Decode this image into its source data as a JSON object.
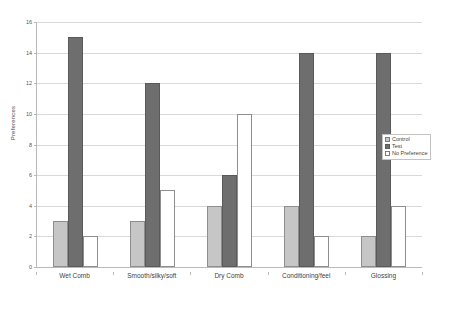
{
  "chart_data": {
    "type": "bar",
    "title": "",
    "subtitle": "",
    "xlabel": "",
    "ylabel": "Preferences",
    "ylim": [
      0,
      16
    ],
    "ytick_step": 2,
    "yticks": [
      0,
      2,
      4,
      6,
      8,
      10,
      12,
      14,
      16
    ],
    "grid": true,
    "legend_position": "right-middle",
    "categories": [
      "Wet Comb",
      "Smooth/silky/soft",
      "Dry Comb",
      "Conditioning/feel",
      "Glossing"
    ],
    "series": [
      {
        "name": "Control",
        "color": "#c6c6c6",
        "values": [
          3,
          3,
          4,
          4,
          2
        ]
      },
      {
        "name": "Test",
        "color": "#6e6e6e",
        "values": [
          15,
          12,
          6,
          14,
          14
        ]
      },
      {
        "name": "No Preference",
        "color": "#ffffff",
        "values": [
          2,
          5,
          10,
          2,
          4
        ]
      }
    ]
  },
  "legend": {
    "items": [
      {
        "label": "Control"
      },
      {
        "label": "Test"
      },
      {
        "label": "No Preference"
      }
    ]
  },
  "colors": {
    "control": "#c6c6c6",
    "test": "#6e6e6e",
    "no_preference": "#ffffff",
    "axis": "#b9b9b9",
    "gridline": "#d9d9d9",
    "background": "#ffffff"
  }
}
